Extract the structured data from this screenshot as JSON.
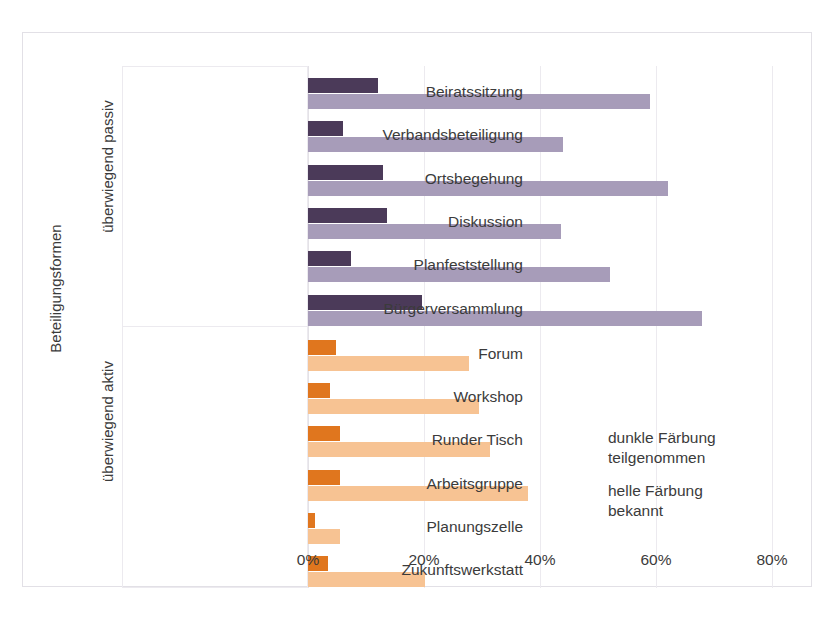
{
  "axis_title": "Beteiligungsformen",
  "groups": [
    {
      "key": "passive",
      "title": "überwiegend passiv"
    },
    {
      "key": "active",
      "title": "überwiegend aktiv"
    }
  ],
  "legend": {
    "dark_line1": "dunkle Färbung",
    "dark_line2": "teilgenommen",
    "light_line1": "helle Färbung",
    "light_line2": "bekannt"
  },
  "colors": {
    "dark_purple": "#4b3a59",
    "light_purple": "#a79cb9",
    "dark_orange": "#e0761e",
    "light_orange": "#f7c393",
    "grid": "#eceaef",
    "text": "#3b3b3b"
  },
  "chart_data": {
    "type": "bar",
    "orientation": "horizontal",
    "title": "",
    "xlabel": "",
    "ylabel": "Beteiligungsformen",
    "xlim": [
      0,
      80
    ],
    "xticks": [
      0,
      20,
      40,
      60,
      80
    ],
    "xtick_labels": [
      "0%",
      "20%",
      "40%",
      "60%",
      "80%"
    ],
    "grid": true,
    "legend_position": "right-inside",
    "units": "%",
    "series": [
      {
        "name": "teilgenommen",
        "label": "dunkle Färbung"
      },
      {
        "name": "bekannt",
        "label": "helle Färbung"
      }
    ],
    "categories": [
      "Beiratssitzung",
      "Verbandsbeteiligung",
      "Ortsbegehung",
      "Diskussion",
      "Planfeststellung",
      "Bürgerversammlung",
      "Forum",
      "Workshop",
      "Runder Tisch",
      "Arbeitsgruppe",
      "Planungszelle",
      "Zukunftswerkstatt"
    ],
    "groups": [
      "überwiegend passiv",
      "überwiegend passiv",
      "überwiegend passiv",
      "überwiegend passiv",
      "überwiegend passiv",
      "überwiegend passiv",
      "überwiegend aktiv",
      "überwiegend aktiv",
      "überwiegend aktiv",
      "überwiegend aktiv",
      "überwiegend aktiv",
      "überwiegend aktiv"
    ],
    "teilgenommen": [
      12,
      6,
      13,
      13.6,
      7.4,
      19.6,
      4.8,
      3.8,
      5.6,
      5.6,
      1.2,
      3.5
    ],
    "bekannt": [
      59,
      44,
      62,
      43.6,
      52,
      68,
      27.7,
      29.5,
      31.4,
      38,
      5.6,
      20.2
    ]
  },
  "bars": [
    {
      "category": "Beiratssitzung",
      "group": "passive",
      "dark": 12,
      "light": 59
    },
    {
      "category": "Verbandsbeteiligung",
      "group": "passive",
      "dark": 6,
      "light": 44
    },
    {
      "category": "Ortsbegehung",
      "group": "passive",
      "dark": 13,
      "light": 62
    },
    {
      "category": "Diskussion",
      "group": "passive",
      "dark": 13.6,
      "light": 43.6
    },
    {
      "category": "Planfeststellung",
      "group": "passive",
      "dark": 7.4,
      "light": 52
    },
    {
      "category": "Bürgerversammlung",
      "group": "passive",
      "dark": 19.6,
      "light": 68
    },
    {
      "category": "Forum",
      "group": "active",
      "dark": 4.8,
      "light": 27.7
    },
    {
      "category": "Workshop",
      "group": "active",
      "dark": 3.8,
      "light": 29.5
    },
    {
      "category": "Runder Tisch",
      "group": "active",
      "dark": 5.6,
      "light": 31.4
    },
    {
      "category": "Arbeitsgruppe",
      "group": "active",
      "dark": 5.6,
      "light": 38
    },
    {
      "category": "Planungszelle",
      "group": "active",
      "dark": 1.2,
      "light": 5.6
    },
    {
      "category": "Zukunftswerkstatt",
      "group": "active",
      "dark": 3.5,
      "light": 20.2
    }
  ]
}
